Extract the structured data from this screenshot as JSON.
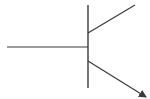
{
  "diagram": {
    "type": "npn-transistor-symbol",
    "stroke_color": "#3a3a3a",
    "background": "#ffffff",
    "elements": {
      "base_lead": {
        "x1": 7,
        "y1": 47,
        "x2": 88,
        "y2": 47
      },
      "base_bar": {
        "x1": 88,
        "y1": 5,
        "x2": 88,
        "y2": 88
      },
      "collector_lead": {
        "x1": 88,
        "y1": 33,
        "x2": 135,
        "y2": 5
      },
      "emitter_lead": {
        "x1": 88,
        "y1": 61,
        "x2": 146,
        "y2": 97
      },
      "emitter_arrow": "arrow-head"
    }
  }
}
